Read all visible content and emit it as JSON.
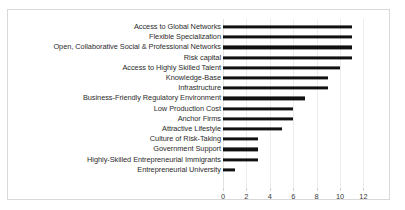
{
  "chart_data": {
    "type": "bar",
    "orientation": "horizontal",
    "title": "",
    "xlabel": "",
    "ylabel": "",
    "xlim": [
      0,
      12
    ],
    "grid": true,
    "legend": null,
    "bar_color": "#111111",
    "gridline_color": "#ededed",
    "border_color": "#d9d9d9",
    "xticks": [
      "0",
      "2",
      "4",
      "6",
      "8",
      "10",
      "12"
    ],
    "xtick_values": [
      0,
      2,
      4,
      6,
      8,
      10,
      12
    ],
    "categories": [
      "Access to Global Networks",
      "Flexible Specialization",
      "Open, Collaborative Social & Professional Networks",
      "Risk capital",
      "Access to Highly Skilled Talent",
      "Knowledge-Base",
      "Infrastructure",
      "Business-Friendly Regulatory Environment",
      "Low Production Cost",
      "Anchor Firms",
      "Attractive Lifestyle",
      "Culture of Risk-Taking",
      "Government Support",
      "Highly-Skilled Entrepreneurial Immigrants",
      "Entrepreneurial University"
    ],
    "values": [
      11,
      11,
      11,
      11,
      10,
      9,
      9,
      7,
      6,
      6,
      5,
      3,
      3,
      3,
      1
    ]
  }
}
